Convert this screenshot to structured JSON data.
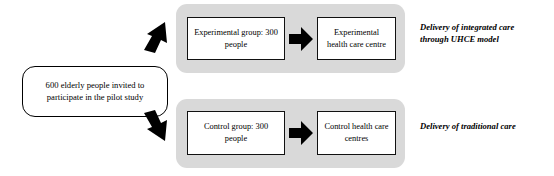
{
  "diagram": {
    "source": {
      "label": "600 elderly people invited to participate in the pilot study"
    },
    "rows": [
      {
        "id": "experimental",
        "group_box": "Experimental group: 300 people",
        "destination_box": "Experimental health care centre",
        "caption": "Delivery of integrated care through UHCE model"
      },
      {
        "id": "control",
        "group_box": "Control group: 300 people",
        "destination_box": "Control health care centres",
        "caption": "Delivery of traditional care"
      }
    ],
    "icons": {
      "branch_up": "arrow-up-right-icon",
      "branch_down": "arrow-down-right-icon",
      "flow_right": "arrow-right-icon"
    },
    "colors": {
      "band": "#d9d9d9",
      "stroke": "#000000",
      "box_fill": "#ffffff",
      "page": "#ffffff"
    }
  }
}
